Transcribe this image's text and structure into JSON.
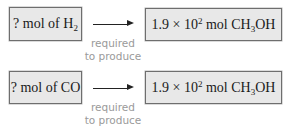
{
  "rows": [
    {
      "left": {
        "prefix": "? mol of H",
        "subscript": "2",
        "suffix": ""
      },
      "arrow_caption": [
        "required",
        "to produce"
      ],
      "right": {
        "coefficient": "1.9",
        "times": "×",
        "base": "10",
        "exponent": "2",
        "unit_prefix": "mol CH",
        "unit_subscript": "3",
        "unit_suffix": "OH"
      }
    },
    {
      "left": {
        "prefix": "? mol of CO",
        "subscript": "",
        "suffix": ""
      },
      "arrow_caption": [
        "required",
        "to produce"
      ],
      "right": {
        "coefficient": "1.9",
        "times": "×",
        "base": "10",
        "exponent": "2",
        "unit_prefix": "mol CH",
        "unit_subscript": "3",
        "unit_suffix": "OH"
      }
    }
  ],
  "colors": {
    "box_fill": "#e8e8e8",
    "box_border": "#6e6e6e",
    "caption": "#9a9a9a",
    "arrow": "#222222"
  }
}
